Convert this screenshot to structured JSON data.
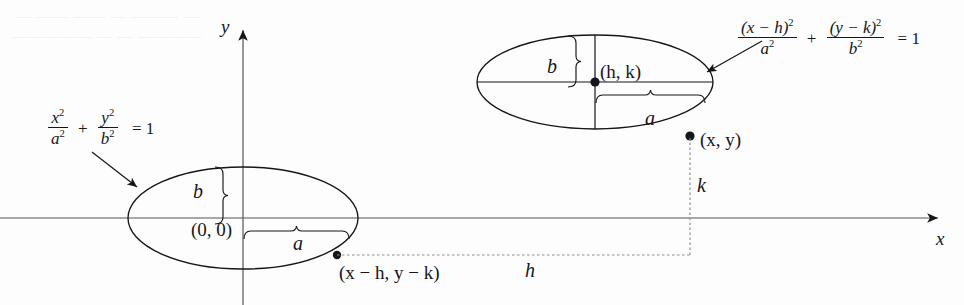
{
  "figure": {
    "background_color": "#fdfdfd",
    "ink_color": "#16161a",
    "dashed_color": "#8d8d8d"
  },
  "axes": {
    "x_label": "x",
    "y_label": "y",
    "x_axis_y": 218,
    "y_axis_x": 243,
    "x_arrow_tip_x": 947,
    "y_arrow_tip_y": 22
  },
  "equations": {
    "standard": {
      "num1": "x",
      "num1_sup": "2",
      "den1": "a",
      "den1_sup": "2",
      "plus": "+",
      "num2": "y",
      "num2_sup": "2",
      "den2": "b",
      "den2_sup": "2",
      "equals": "= 1",
      "full_text": "x^2/a^2 + y^2/b^2 = 1"
    },
    "translated": {
      "num1": "(x − h)",
      "num1_sup": "2",
      "den1": "a",
      "den1_sup": "2",
      "plus": "+",
      "num2": "(y − k)",
      "num2_sup": "2",
      "den2": "b",
      "den2_sup": "2",
      "equals": "= 1",
      "full_text": "(x-h)^2/a^2 + (y-k)^2/b^2 = 1"
    }
  },
  "origin_ellipse": {
    "name": "ellipse-at-origin",
    "center_label": "(0, 0)",
    "center_x": 243,
    "center_y": 218,
    "semi_major_label": "a",
    "semi_minor_label": "b",
    "rx": 115,
    "ry": 51,
    "point_label": "(x − h, y − k)",
    "point_x": 337,
    "point_y": 255
  },
  "translated_ellipse": {
    "name": "ellipse-translated",
    "center_label": "(h, k)",
    "center_x": 595,
    "center_y": 82,
    "semi_major_label": "a",
    "semi_minor_label": "b",
    "rx": 118,
    "ry": 47,
    "point_label": "(x, y)",
    "point_x": 690,
    "point_y": 136
  },
  "offsets": {
    "horizontal_label": "h",
    "vertical_label": "k",
    "dashed_y": 255,
    "dashed_x": 690
  },
  "bleed_through": {
    "line1": "— —— —— — ——— —",
    "line2": "————— — — ————"
  }
}
